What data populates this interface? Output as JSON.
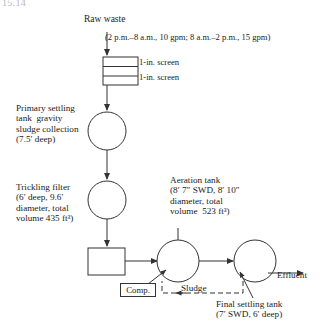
{
  "figure": {
    "number": "15.14",
    "type": "process-flow-diagram"
  },
  "labels": {
    "raw_waste": "Raw waste",
    "flow_note": "(2 p.m.–8 a.m., 10 gpm; 8 a.m.–2 p.m., 15 gpm)",
    "screen_coarse": "1-in. screen",
    "screen_fine": "1-in. screen",
    "primary_settling": "Primary settling\ntank  gravity\nsludge collection\n(7.5′ deep)",
    "trickling_filter": "Trickling filter\n(6′ deep, 9.6′\ndiameter, total\nvolume 435 ft³)",
    "aeration_tank": "Aeration tank\n(8′ 7″ SWD, 8′ 10″\ndiameter, total\nvolume  523 ft³)",
    "comp": "Comp.",
    "sludge": "Sludge",
    "effluent": "Effluent",
    "final_settling": "Final settling tank\n(7′ SWD, 6′ deep)"
  },
  "units": [
    {
      "id": "bar-screens",
      "name": "Bar screens",
      "shape": "rectangle",
      "rows": 2,
      "label_lines": [
        "1-in. screen",
        "1-in. screen"
      ]
    },
    {
      "id": "primary-settling-tank",
      "name": "Primary settling tank",
      "shape": "circle",
      "depth": "7.5′",
      "note": "gravity sludge collection"
    },
    {
      "id": "trickling-filter",
      "name": "Trickling filter",
      "shape": "circle",
      "depth": "6′",
      "diameter": "9.6′",
      "total_volume": "435 ft³"
    },
    {
      "id": "comp-unit",
      "name": "Comp.",
      "shape": "rectangle"
    },
    {
      "id": "aeration-tank",
      "name": "Aeration tank",
      "shape": "circle",
      "swd": "8′ 7″",
      "diameter": "8′ 10″",
      "total_volume": "523 ft³"
    },
    {
      "id": "final-settling-tank",
      "name": "Final settling tank",
      "shape": "circle",
      "swd": "7′",
      "depth": "6′"
    }
  ],
  "flows": [
    {
      "from": "raw-waste",
      "to": "bar-screens",
      "style": "solid",
      "label": "Raw waste"
    },
    {
      "from": "bar-screens",
      "to": "primary-settling-tank",
      "style": "solid"
    },
    {
      "from": "primary-settling-tank",
      "to": "trickling-filter",
      "style": "solid"
    },
    {
      "from": "trickling-filter",
      "to": "comp-unit",
      "style": "solid"
    },
    {
      "from": "comp-unit",
      "to": "aeration-tank",
      "style": "solid"
    },
    {
      "from": "aeration-tank",
      "to": "final-settling-tank",
      "style": "solid"
    },
    {
      "from": "final-settling-tank",
      "to": "effluent",
      "style": "solid",
      "label": "Effluent"
    },
    {
      "from": "final-settling-tank",
      "to": "aeration-tank",
      "style": "dashed",
      "label": "Sludge"
    },
    {
      "from": "comp-label",
      "to": "aeration-tank",
      "style": "solid"
    }
  ],
  "colors": {
    "line": "#333333",
    "text": "#1b1b1b",
    "background": "#ffffff",
    "figure_number": "#b9b9b9"
  }
}
